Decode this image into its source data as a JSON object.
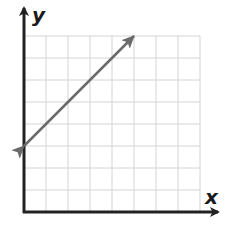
{
  "chart_data": {
    "type": "line",
    "title": "",
    "xlabel": "x",
    "ylabel": "y",
    "xlim": [
      0,
      8
    ],
    "ylim": [
      0,
      8
    ],
    "grid": true,
    "tick_labels": false,
    "series": [
      {
        "name": "line",
        "x": [
          0,
          5
        ],
        "y": [
          3,
          8
        ],
        "arrows_both_ends": true,
        "equation": "y = x + 3"
      }
    ]
  },
  "labels": {
    "x_axis": "x",
    "y_axis": "y"
  },
  "colors": {
    "axis": "#222222",
    "grid": "#d4d4d4",
    "line": "#6a6a6a"
  }
}
